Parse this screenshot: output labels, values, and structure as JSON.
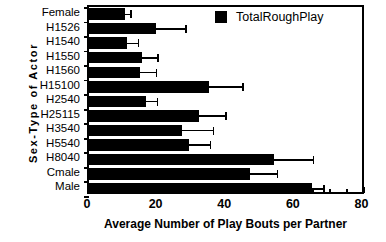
{
  "chart_data": {
    "type": "bar",
    "orientation": "horizontal",
    "title": "",
    "xlabel": "Average Number of Play Bouts per Partner",
    "ylabel": "Sex-Type of Actor",
    "xlim": [
      0,
      80
    ],
    "xticks": [
      0,
      20,
      40,
      60,
      80
    ],
    "xtick_labels": [
      "0",
      "20",
      "40",
      "60",
      "80"
    ],
    "grid": false,
    "legend": {
      "position": "top-right",
      "entries": [
        {
          "name": "TotalRoughPlay",
          "color": "#000000"
        }
      ]
    },
    "categories": [
      "Female",
      "H1526",
      "H1540",
      "H1550",
      "H1560",
      "H15100",
      "H2540",
      "H25115",
      "H3540",
      "H5540",
      "H8040",
      "Cmale",
      "Male"
    ],
    "series": [
      {
        "name": "TotalRoughPlay",
        "color": "#000000",
        "values": [
          10.5,
          19.5,
          11.0,
          15.5,
          15.0,
          35.0,
          16.5,
          32.0,
          27.0,
          29.0,
          54.0,
          47.0,
          65.0
        ],
        "errors": [
          1.8,
          8.8,
          3.5,
          4.7,
          4.7,
          10.0,
          3.5,
          8.0,
          9.4,
          6.5,
          11.5,
          8.0,
          3.5
        ]
      }
    ]
  },
  "legend": {
    "label": "TotalRoughPlay"
  },
  "axes": {
    "x_title": "Average Number of Play Bouts per Partner",
    "y_title": "Sex-Type of Actor"
  }
}
